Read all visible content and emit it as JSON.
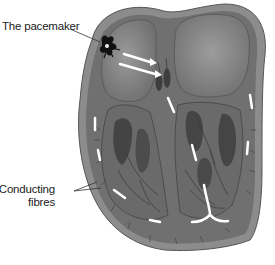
{
  "diagram": {
    "labels": {
      "pacemaker": "The pacemaker",
      "conducting_line1": "Conducting",
      "conducting_line2": "fibres"
    },
    "colors": {
      "background": "#ffffff",
      "outer_wall": "#7a7a7a",
      "muscle": "#6e6e6e",
      "chamber": "#8a8a8a",
      "dark_tissue": "#4a4a4a",
      "arrows": "#ffffff",
      "text": "#222222"
    }
  }
}
